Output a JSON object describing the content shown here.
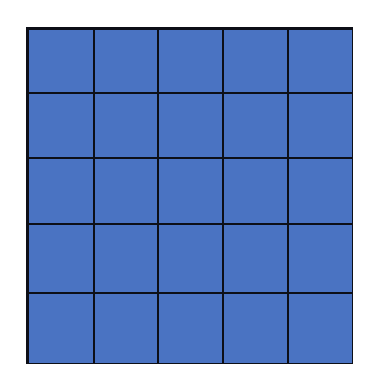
{
  "grid": {
    "rows": 5,
    "columns": 5,
    "cell_color": "#4a73c2",
    "line_color": "#0d0f17",
    "background": "#ffffff"
  }
}
